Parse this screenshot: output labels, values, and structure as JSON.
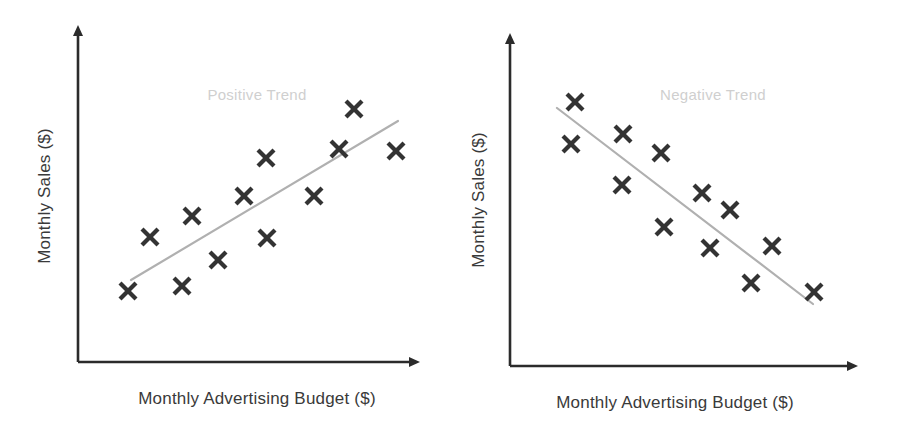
{
  "figure": {
    "width": 907,
    "height": 442,
    "background": "#ffffff",
    "marker_color": "#333333",
    "axis_color": "#2b2b2b",
    "trend_color": "#b0b0b0",
    "trend_label_color": "#cfcfcf",
    "label_color": "#3a3a3a"
  },
  "chart_data": [
    {
      "type": "scatter",
      "title": "",
      "annotation": "Positive Trend",
      "xlabel": "Monthly Advertising Budget ($)",
      "ylabel": "Monthly Sales ($)",
      "grid": false,
      "legend": "none",
      "axis_ticks": false,
      "xlim": [
        0,
        10
      ],
      "ylim": [
        0,
        10
      ],
      "x": [
        1.0,
        1.7,
        2.7,
        3.0,
        3.8,
        4.7,
        4.9,
        5.6,
        7.0,
        7.5,
        7.9,
        9.0
      ],
      "y": [
        1.2,
        3.0,
        1.4,
        4.1,
        2.2,
        5.1,
        7.3,
        3.1,
        5.1,
        8.9,
        6.7,
        6.6
      ],
      "points_px": [
        {
          "x": 128,
          "y": 291
        },
        {
          "x": 150,
          "y": 237
        },
        {
          "x": 182,
          "y": 286
        },
        {
          "x": 192,
          "y": 216
        },
        {
          "x": 218,
          "y": 260
        },
        {
          "x": 244,
          "y": 196
        },
        {
          "x": 266,
          "y": 158
        },
        {
          "x": 267,
          "y": 238
        },
        {
          "x": 314,
          "y": 196
        },
        {
          "x": 339,
          "y": 149
        },
        {
          "x": 354,
          "y": 109
        },
        {
          "x": 396,
          "y": 151
        }
      ],
      "trend_px": {
        "x1": 131,
        "y1": 280,
        "x2": 398,
        "y2": 121
      },
      "annotation_px": {
        "x": 257,
        "y": 100
      },
      "axes_px": {
        "origin": {
          "x": 78,
          "y": 362
        },
        "y_top": {
          "x": 78,
          "y": 25
        },
        "x_right": {
          "x": 420,
          "y": 362
        }
      },
      "xlabel_px": {
        "x": 257,
        "y": 404
      },
      "ylabel_px": {
        "x": 50,
        "y": 196
      }
    },
    {
      "type": "scatter",
      "title": "",
      "annotation": "Negative Trend",
      "xlabel": "Monthly Advertising Budget ($)",
      "ylabel": "Monthly Sales ($)",
      "grid": false,
      "legend": "none",
      "axis_ticks": false,
      "xlim": [
        0,
        10
      ],
      "ylim": [
        0,
        10
      ],
      "x": [
        1.2,
        1.0,
        2.5,
        2.4,
        3.4,
        4.0,
        4.6,
        5.4,
        5.0,
        6.8,
        6.1,
        8.0
      ],
      "y": [
        8.9,
        7.7,
        8.0,
        6.5,
        7.4,
        5.8,
        5.0,
        4.1,
        3.8,
        3.9,
        2.8,
        2.5
      ],
      "points_px": [
        {
          "x": 575,
          "y": 102
        },
        {
          "x": 571,
          "y": 144
        },
        {
          "x": 623,
          "y": 134
        },
        {
          "x": 622,
          "y": 185
        },
        {
          "x": 661,
          "y": 153
        },
        {
          "x": 664,
          "y": 227
        },
        {
          "x": 702,
          "y": 193
        },
        {
          "x": 730,
          "y": 210
        },
        {
          "x": 710,
          "y": 248
        },
        {
          "x": 772,
          "y": 246
        },
        {
          "x": 751,
          "y": 283
        },
        {
          "x": 814,
          "y": 292
        }
      ],
      "trend_px": {
        "x1": 557,
        "y1": 108,
        "x2": 813,
        "y2": 304
      },
      "annotation_px": {
        "x": 713,
        "y": 100
      },
      "axes_px": {
        "origin": {
          "x": 510,
          "y": 366
        },
        "y_top": {
          "x": 510,
          "y": 33
        },
        "x_right": {
          "x": 858,
          "y": 366
        }
      },
      "xlabel_px": {
        "x": 675,
        "y": 408
      },
      "ylabel_px": {
        "x": 484,
        "y": 200
      }
    }
  ]
}
